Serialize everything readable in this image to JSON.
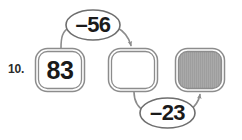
{
  "problem": {
    "number_label": "10.",
    "type": "function-machine-flow"
  },
  "colors": {
    "stroke": "#8c8c8c",
    "stroke_dark": "#6e6e6e",
    "text": "#1a1a1a",
    "shaded_fill": "#a9a9a9",
    "background": "#ffffff"
  },
  "nodes": [
    {
      "id": "box-1",
      "shape": "rounded-square",
      "value": "83",
      "filled": false,
      "blank": false
    },
    {
      "id": "box-2",
      "shape": "rounded-square",
      "value": "",
      "filled": false,
      "blank": true
    },
    {
      "id": "box-3",
      "shape": "rounded-square",
      "value": "",
      "filled": true,
      "blank": true
    }
  ],
  "operations": [
    {
      "id": "op-1",
      "shape": "ellipse",
      "value": "–56",
      "from": "box-1",
      "to": "box-2",
      "position": "above"
    },
    {
      "id": "op-2",
      "shape": "ellipse",
      "value": "–23",
      "from": "box-2",
      "to": "box-3",
      "position": "below"
    }
  ],
  "arrows": [
    {
      "id": "arrow-1",
      "from": "box-1",
      "to": "box-2",
      "via": "op-1",
      "direction": "right"
    },
    {
      "id": "arrow-2",
      "from": "box-2",
      "to": "box-3",
      "via": "op-2",
      "direction": "right"
    }
  ]
}
